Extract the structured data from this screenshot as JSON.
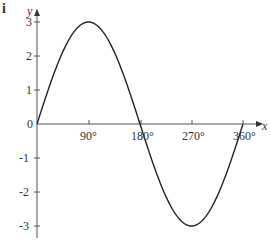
{
  "part_label": "i",
  "chart_data": {
    "type": "line",
    "title": "",
    "function": "y = 3 sin x",
    "xlabel": "x",
    "ylabel": "y",
    "x_ticks": [
      "90°",
      "180°",
      "270°",
      "360°"
    ],
    "y_ticks": [
      "3",
      "2",
      "1",
      "0",
      "-1",
      "-2",
      "-3"
    ],
    "xlim": [
      0,
      360
    ],
    "ylim": [
      -3,
      3
    ],
    "grid": false,
    "x": [
      0,
      45,
      90,
      135,
      180,
      225,
      270,
      315,
      360
    ],
    "series": [
      {
        "name": "y",
        "values": [
          0,
          2.12,
          3,
          2.12,
          0,
          -2.12,
          -3,
          -2.12,
          0
        ]
      }
    ]
  }
}
